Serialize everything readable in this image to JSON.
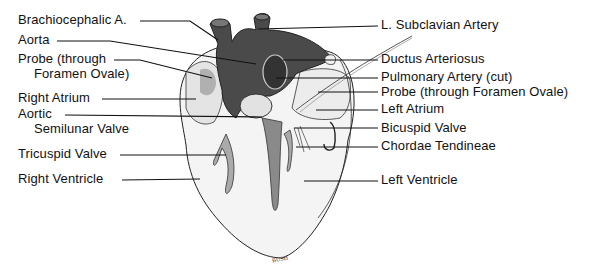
{
  "figure": {
    "signature": "BUSH",
    "colors": {
      "vessel_fill": "#4a4a4a",
      "tissue_fill": "#f2f2f2",
      "shadow_fill": "#9a9a9a",
      "outline": "#222222",
      "leader_line": "#111111"
    }
  },
  "labels_left": [
    {
      "id": "brachiocephalic",
      "text": "Brachiocephalic A.",
      "x": 18,
      "y": 14
    },
    {
      "id": "aorta",
      "text": "Aorta",
      "x": 18,
      "y": 34
    },
    {
      "id": "probe-left-1",
      "text": "Probe (through",
      "x": 18,
      "y": 53
    },
    {
      "id": "probe-left-2",
      "text": "Foramen Ovale)",
      "x": 34,
      "y": 68
    },
    {
      "id": "right-atrium",
      "text": "Right Atrium",
      "x": 18,
      "y": 92
    },
    {
      "id": "aortic-1",
      "text": "Aortic",
      "x": 18,
      "y": 108
    },
    {
      "id": "aortic-2",
      "text": "Semilunar Valve",
      "x": 34,
      "y": 123
    },
    {
      "id": "tricuspid",
      "text": "Tricuspid Valve",
      "x": 18,
      "y": 148
    },
    {
      "id": "right-ventricle",
      "text": "Right Ventricle",
      "x": 18,
      "y": 173
    }
  ],
  "labels_right": [
    {
      "id": "l-subclavian",
      "text": "L. Subclavian Artery",
      "x": 381,
      "y": 17
    },
    {
      "id": "ductus",
      "text": "Ductus Arteriosus",
      "x": 381,
      "y": 52
    },
    {
      "id": "pulmonary",
      "text": "Pulmonary Artery (cut)",
      "x": 381,
      "y": 70
    },
    {
      "id": "probe-right",
      "text": "Probe (through Foramen Ovale)",
      "x": 381,
      "y": 86
    },
    {
      "id": "left-atrium",
      "text": "Left Atrium",
      "x": 381,
      "y": 103
    },
    {
      "id": "bicuspid",
      "text": "Bicuspid Valve",
      "x": 381,
      "y": 123
    },
    {
      "id": "chordae",
      "text": "Chordae Tendineae",
      "x": 381,
      "y": 138
    },
    {
      "id": "left-ventricle",
      "text": "Left Ventricle",
      "x": 381,
      "y": 172
    }
  ]
}
